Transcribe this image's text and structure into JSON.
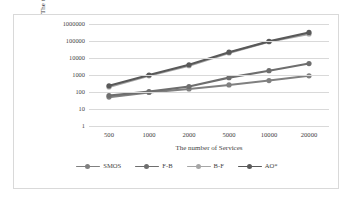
{
  "chart_data": {
    "type": "line",
    "title": "",
    "xlabel": "The number of Services",
    "ylabel": "The time of Matching(S)",
    "x": [
      500,
      1000,
      2000,
      5000,
      10000,
      20000
    ],
    "categories": [
      "500",
      "1000",
      "2000",
      "5000",
      "10000",
      "20000"
    ],
    "xtick_labels": [
      "500",
      "1000",
      "2000",
      "5000",
      "10000",
      "20000"
    ],
    "ytick_labels": [
      "1",
      "10",
      "100",
      "1000",
      "10000",
      "100000",
      "1000000"
    ],
    "ytick_values": [
      1,
      10,
      100,
      1000,
      10000,
      100000,
      1000000
    ],
    "yscale": "log",
    "ylim": [
      1,
      1000000
    ],
    "grid": "horizontal",
    "legend_position": "bottom",
    "series": [
      {
        "name": "SMOS",
        "color": "#808080",
        "values": [
          50,
          95,
          150,
          260,
          470,
          900
        ]
      },
      {
        "name": "F-B",
        "color": "#6e6e6e",
        "values": [
          62,
          105,
          210,
          700,
          1800,
          4700
        ]
      },
      {
        "name": "B-F",
        "color": "#a6a6a6",
        "values": [
          200,
          900,
          3500,
          20000,
          90000,
          260000
        ]
      },
      {
        "name": "AO*",
        "color": "#595959",
        "values": [
          230,
          1000,
          4000,
          22000,
          95000,
          320000
        ]
      }
    ]
  },
  "legend": {
    "items": [
      {
        "label": "SMOS",
        "color": "#808080"
      },
      {
        "label": "F-B",
        "color": "#6e6e6e"
      },
      {
        "label": "B-F",
        "color": "#a6a6a6"
      },
      {
        "label": "AO*",
        "color": "#595959"
      }
    ]
  },
  "colors": {
    "gridline": "#d9d9d9",
    "border": "#d9d9d9",
    "text": "#3f3f3f",
    "background": "#ffffff"
  }
}
